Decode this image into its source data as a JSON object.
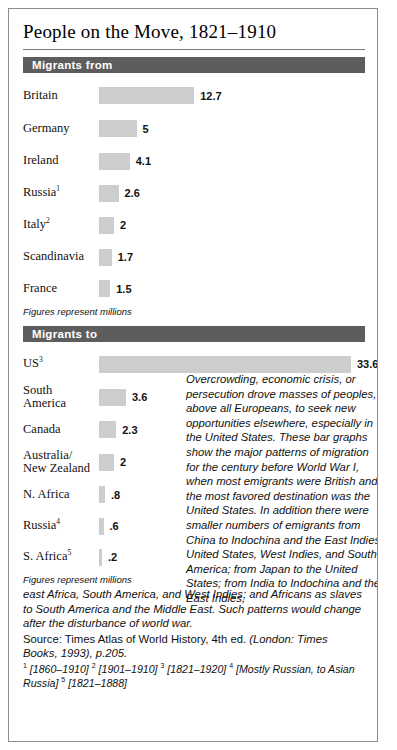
{
  "figure": {
    "title": "People on the Move, 1821–1910"
  },
  "chart_data": [
    {
      "type": "bar",
      "title": "Migrants from",
      "orientation": "horizontal",
      "unit_note": "Figures represent millions",
      "xlabel": "",
      "ylabel": "",
      "xlim": [
        0,
        33.6
      ],
      "grid": false,
      "legend": "none",
      "categories": [
        "Britain",
        "Germany",
        "Ireland",
        "Russia",
        "Italy",
        "Scandinavia",
        "France"
      ],
      "category_footnotes": [
        "",
        "",
        "",
        "1",
        "2",
        "",
        ""
      ],
      "values": [
        12.7,
        5,
        4.1,
        2.6,
        2,
        1.7,
        1.5
      ],
      "value_labels": [
        "12.7",
        "5",
        "4.1",
        "2.6",
        "2",
        "1.7",
        "1.5"
      ]
    },
    {
      "type": "bar",
      "title": "Migrants to",
      "orientation": "horizontal",
      "unit_note": "Figures represent millions",
      "xlabel": "",
      "ylabel": "",
      "xlim": [
        0,
        33.6
      ],
      "grid": false,
      "legend": "none",
      "categories": [
        "US",
        "South\nAmerica",
        "Canada",
        "Australia/\nNew Zealand",
        "N. Africa",
        "Russia",
        "S. Africa"
      ],
      "category_footnotes": [
        "3",
        "",
        "",
        "",
        "",
        "4",
        "5"
      ],
      "values": [
        33.6,
        3.6,
        2.3,
        2,
        0.8,
        0.6,
        0.2
      ],
      "value_labels": [
        "33.6",
        "3.6",
        "2.3",
        "2",
        ".8",
        ".6",
        ".2"
      ]
    }
  ],
  "side_text": "Overcrowding, economic crisis, or persecution drove masses of peoples, above all Europeans, to seek new opportunities elsewhere, especially in the United States. These bar graphs show the major patterns of migration for the century before World War I, when most emigrants were British and the most favored destination was the United States. In addition there were smaller numbers of emigrants from China to Indochina and the East Indies, United States, West Indies, and South America; from Japan to the United States; from India to Indochina and the East Indies,",
  "body_continued": "east Africa, South America, and West Indies; and Africans as slaves to South America and the Middle East. Such patterns would change after the disturbance of world war.",
  "source": {
    "prefix": "Source: Times Atlas of World History, 4th ed. ",
    "italic_part": "(London: Times Books, 1993), p.205."
  },
  "footnotes": {
    "n1": "[1860–1910]",
    "n2": "[1901–1910]",
    "n3": "[1821–1920]",
    "n4": "[Mostly Russian, to Asian Russia]",
    "n5": "[1821–1888]"
  },
  "colors": {
    "header_bar": "#5d5d5d",
    "data_bar": "#cdcdcd",
    "frame": "#8d8d8d",
    "text": "#111111"
  }
}
